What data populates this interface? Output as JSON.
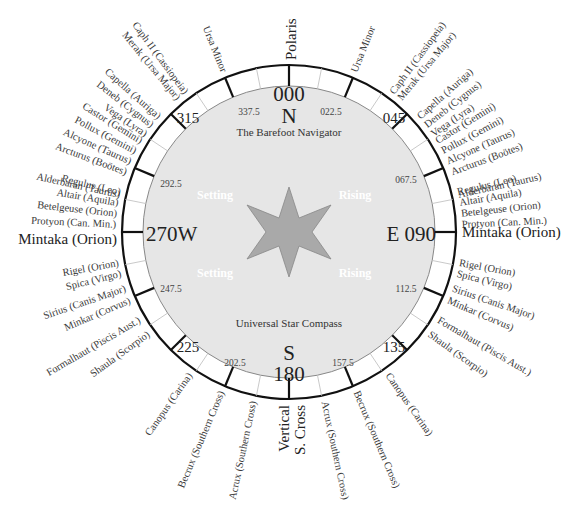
{
  "compass": {
    "title_top": "The Barefoot Navigator",
    "title_bottom": "Universal Star Compass",
    "center": [
      289,
      232
    ],
    "outer_radius": 167,
    "inner_radius": 146,
    "colors": {
      "disc": "#e6e6e6",
      "ring": "#ffffff",
      "stroke": "#111111",
      "star": "#a8a8a8",
      "label": "#3a3a3a"
    },
    "cardinals": {
      "north": {
        "number": "000",
        "letter": "N"
      },
      "east": "E 090",
      "south": {
        "letter": "S",
        "number": "180"
      },
      "west": "270W"
    },
    "intercardinals": {
      "ne": "045",
      "se": "135",
      "sw": "225",
      "nw": "315"
    },
    "minor_bearings": {
      "nne": "022.5",
      "ene": "067.5",
      "ese": "112.5",
      "sse": "157.5",
      "ssw": "202.5",
      "wsw": "247.5",
      "wnw": "292.5",
      "nnw": "337.5"
    },
    "quadrant_words": {
      "nw": "Setting",
      "ne": "Rising",
      "sw": "Setting",
      "se": "Rising"
    },
    "outer_labels": {
      "north": "Polaris",
      "south": [
        "Vertical",
        "S. Cross"
      ],
      "east": "Mintaka (Orion)",
      "west": "Mintaka (Orion)"
    },
    "star_labels": {
      "nnw_ursa": "Ursa Minor",
      "nne_ursa": "Ursa Minor",
      "nw_a": [
        "Caph II (Cassiopeia)",
        "Merak (Ursa Major)"
      ],
      "ne_a": [
        "Caph II (Cassiopeia)",
        "Merak (Ursa Major)"
      ],
      "nw_b": [
        "Capella (Auriga)",
        "Deneb (Cygnus)",
        "Vega (Lyra)"
      ],
      "ne_b": [
        "Capella (Auriga)",
        "Deneb (Cygnus)",
        "Vega (Lyra)"
      ],
      "w_upper": [
        "Castor (Gemini)",
        "Pollux (Gemini)",
        "Alcyone (Taurus)",
        "Arcturus (Boötes)"
      ],
      "e_upper": [
        "Castor (Gemini)",
        "Pollux (Gemini)",
        "Alcyone (Taurus)",
        "Arcturus (Boötes)"
      ],
      "w_mid": [
        "Alderbaran (Taurus)"
      ],
      "e_mid": [
        "Alderbaran (Taurus)"
      ],
      "w_low": [
        "Regulus (Leo)",
        "Altair (Aquila)",
        "Betelgeuse (Orion)",
        "Protyon (Can. Min.)"
      ],
      "e_low": [
        "Regulus (Leo)",
        "Altair (Aquila)",
        "Betelgeuse (Orion)",
        "Protyon (Can. Min.)"
      ],
      "w_south_a": [
        "Rigel (Orion)",
        "Spica (Virgo)"
      ],
      "e_south_a": [
        "Rigel (Orion)",
        "Spica (Virgo)"
      ],
      "w_south_b": [
        "Sirius (Canis Major)",
        "Minkar (Corvus)"
      ],
      "e_south_b": [
        "Sirius (Canis Major)",
        "Minkar (Corvus)"
      ],
      "w_south_c": [
        "Formalhaut (Piscis Aust.)",
        "Shaula (Scorpio)"
      ],
      "e_south_c": [
        "Formalhaut (Piscis Aust.)",
        "Shaula (Scorpio)"
      ],
      "sw_canopus": "Canopus (Carina)",
      "se_canopus": "Canopus (Carina)",
      "sw_becrux": "Becrux (Southern Cross)",
      "se_becrux": "Becrux (Southern Cross)",
      "ssw_acrux": "Acrux (Southern Cross)",
      "sse_acrux": "Acrux (Southern Cross)"
    }
  }
}
